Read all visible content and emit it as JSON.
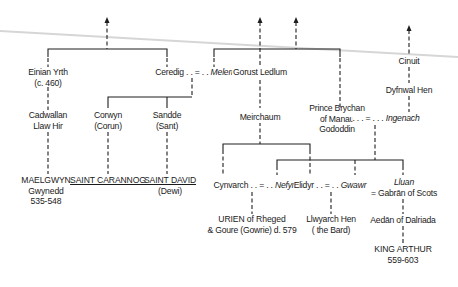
{
  "diagram": {
    "type": "family-tree",
    "nodes": {
      "einian": {
        "lines": [
          "Einian Yrth",
          "(c. 460)"
        ]
      },
      "cadwallan": {
        "lines": [
          "Cadwallan",
          "Llaw Hir"
        ]
      },
      "maelgwyn": {
        "lines": [
          "MAELGWYN",
          "Gwynedd",
          "535-548"
        ]
      },
      "ceredig": {
        "name": "Ceredig",
        "marriage_sep": " . . = . . ",
        "spouse": "Meleri"
      },
      "corwyn": {
        "lines": [
          "Corwyn",
          "(Corun)"
        ]
      },
      "sandde": {
        "lines": [
          "Sandde",
          "(Sant)"
        ]
      },
      "saint_carannog": {
        "lines": [
          "SAINT CARANNOG"
        ]
      },
      "saint_david": {
        "lines": [
          "SAINT DAVID",
          "(Dewi)"
        ]
      },
      "gorust": {
        "lines": [
          "Gorust Ledlum"
        ]
      },
      "meirchaum": {
        "lines": [
          "Meirchaum"
        ]
      },
      "brychan": {
        "lines": [
          "Prince Brychan",
          "of Manau",
          "Gododdin"
        ]
      },
      "brychan_marriage": {
        "sep": " . . . = . . . ",
        "spouse": "Ingenach"
      },
      "cinuit": {
        "lines": [
          "Cinuit"
        ]
      },
      "dyfnwal": {
        "lines": [
          "Dyfnwal Hen"
        ]
      },
      "cynvarch": {
        "name": "Cynvarch",
        "sep": " . . = . . ",
        "spouse": "Nefyn"
      },
      "elidyr": {
        "name": "Elidyr",
        "sep": " . . = . . ",
        "spouse": "Gwawr"
      },
      "lluan": {
        "lines": [
          "Lluan",
          "= Gabrān of Scots"
        ]
      },
      "urien": {
        "lines": [
          "URIEN of Rheged",
          "& Goure (Gowrie)   d. 579"
        ]
      },
      "llywarch": {
        "lines": [
          "Llwyarch Hen",
          "( the Bard)"
        ]
      },
      "aedan": {
        "lines": [
          "Aedān of Dalriada"
        ]
      },
      "arthur": {
        "lines": [
          "KING ARTHUR",
          "559-603"
        ]
      }
    },
    "colors": {
      "line": "#1e1e1e",
      "fold": "#d4d4d4",
      "background": "#ffffff"
    }
  }
}
